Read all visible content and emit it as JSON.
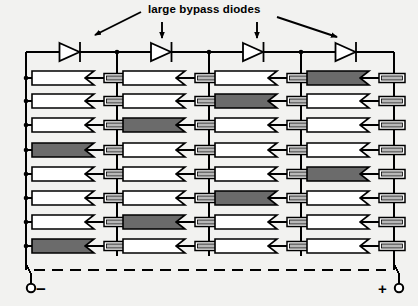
{
  "diagram": {
    "title": "large bypass diodes",
    "type": "solar-module-circuit-schematic",
    "grid": {
      "rows": 8,
      "columns": 4,
      "cell_symbol": "photovoltaic-cell-diode",
      "series_element": "resistor"
    },
    "bypass_diodes": {
      "count": 4,
      "label": "large bypass diodes",
      "orientation": "anode-left-cathode-right"
    },
    "terminals": {
      "negative": {
        "label": "−",
        "name": "negative-terminal",
        "position": "bottom-left"
      },
      "positive": {
        "label": "+",
        "name": "positive-terminal",
        "position": "bottom-right"
      }
    },
    "annotations": {
      "arrows": [
        {
          "name": "arrow-to-diode-1",
          "style": "diagonal-down-left"
        },
        {
          "name": "arrow-to-diode-2",
          "style": "vertical-down"
        },
        {
          "name": "arrow-to-diode-3",
          "style": "vertical-down"
        },
        {
          "name": "arrow-to-diode-4",
          "style": "diagonal-down-right"
        }
      ]
    },
    "colors": {
      "line": "#000000",
      "background": "#f2f2f0",
      "cell_fill_normal": "#ffffff",
      "cell_fill_shaded": "#6b6b6b",
      "resistor_fill": "#ffffff",
      "resistor_bar": "#b8b8b8"
    },
    "shaded_cells": [
      {
        "row": 1,
        "col": 4
      },
      {
        "row": 2,
        "col": 3
      },
      {
        "row": 3,
        "col": 2
      },
      {
        "row": 4,
        "col": 1
      },
      {
        "row": 5,
        "col": 4
      },
      {
        "row": 6,
        "col": 3
      },
      {
        "row": 7,
        "col": 2
      },
      {
        "row": 8,
        "col": 1
      }
    ],
    "geometry": {
      "left_bus_x": 26,
      "right_bus_x": 394,
      "column_bus_x": [
        117,
        209,
        301
      ],
      "diode_row_y": 52,
      "row_y": [
        78,
        101,
        125,
        150,
        174,
        198,
        222,
        246
      ],
      "dashed_bus_y": 270,
      "terminal_y": 288,
      "cell_width": 62,
      "cell_height": 14,
      "resistor_width": 26,
      "resistor_height": 9
    }
  }
}
